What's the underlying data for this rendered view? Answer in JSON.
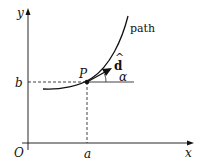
{
  "diagram": {
    "axes": {
      "x_label": "x",
      "y_label": "y",
      "origin_label": "O"
    },
    "point": {
      "label": "P",
      "x_label": "a",
      "y_label": "b"
    },
    "curve_label": "path",
    "vector_label": "d",
    "vector_hat": "^",
    "angle_label": "α"
  }
}
